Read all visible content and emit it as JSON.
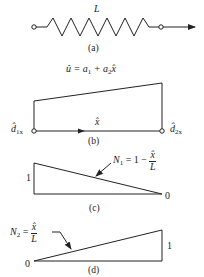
{
  "colors": {
    "line": "#222222",
    "background": "#ffffff"
  },
  "panel_a": {
    "length_label": "L",
    "caption": "(a)"
  },
  "panel_b": {
    "equation_lhs": "û = a",
    "equation_sub1": "1",
    "equation_mid": " + a",
    "equation_sub2": "2",
    "equation_end": "x̂",
    "axis_label": "x̂",
    "left_node_label": "d̂",
    "left_node_sub": "1x",
    "right_node_label": "d̂",
    "right_node_sub": "2x",
    "caption": "(b)"
  },
  "panel_c": {
    "function_label": "N",
    "function_sub": "1",
    "function_eq": " = 1 −",
    "frac_num": "x̂",
    "frac_den": "L",
    "left_value": "1",
    "right_value": "0",
    "caption": "(c)"
  },
  "panel_d": {
    "function_label": "N",
    "function_sub": "2",
    "function_eq": " =",
    "frac_num": "x̂",
    "frac_den": "L",
    "left_value": "0",
    "right_value": "1",
    "caption": "(d)"
  }
}
